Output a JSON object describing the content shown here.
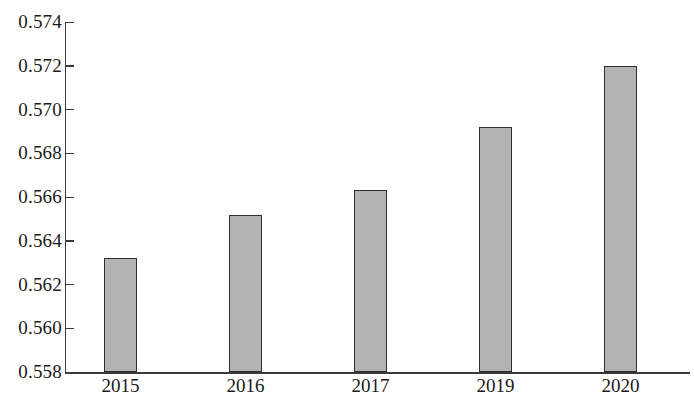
{
  "chart_data": {
    "type": "bar",
    "title": "",
    "subtitle": "",
    "xlabel": "",
    "ylabel": "",
    "categories": [
      "2015",
      "2016",
      "2017",
      "2019",
      "2020"
    ],
    "values": [
      0.5632,
      0.5652,
      0.5663,
      0.5692,
      0.572
    ],
    "series": [
      {
        "name": "",
        "values": [
          0.5632,
          0.5652,
          0.5663,
          0.5692,
          0.572
        ]
      }
    ],
    "ylim": [
      0.558,
      0.574
    ],
    "ytick_values": [
      0.558,
      0.56,
      0.562,
      0.564,
      0.566,
      0.568,
      0.57,
      0.572,
      0.574
    ],
    "ytick_labels": [
      "0.558",
      "0.560",
      "0.562",
      "0.564",
      "0.566",
      "0.568",
      "0.570",
      "0.572",
      "0.574"
    ],
    "ytick_step": 0.002,
    "grid": false,
    "legend": false,
    "legend_position": "none",
    "bar_fill_color": "#b3b3b3",
    "bar_border_color": "#2e2e2e",
    "axis_color": "#3a3a3a",
    "background_color": "#ffffff",
    "annotations": []
  },
  "axis": {
    "y_ticks": [
      {
        "label": "0.574",
        "value": 0.574
      },
      {
        "label": "0.572",
        "value": 0.572
      },
      {
        "label": "0.570",
        "value": 0.57
      },
      {
        "label": "0.568",
        "value": 0.568
      },
      {
        "label": "0.566",
        "value": 0.566
      },
      {
        "label": "0.564",
        "value": 0.564
      },
      {
        "label": "0.562",
        "value": 0.562
      },
      {
        "label": "0.560",
        "value": 0.56
      },
      {
        "label": "0.558",
        "value": 0.558
      }
    ],
    "x_ticks": [
      {
        "label": "2015"
      },
      {
        "label": "2016"
      },
      {
        "label": "2017"
      },
      {
        "label": "2019"
      },
      {
        "label": "2020"
      }
    ]
  }
}
